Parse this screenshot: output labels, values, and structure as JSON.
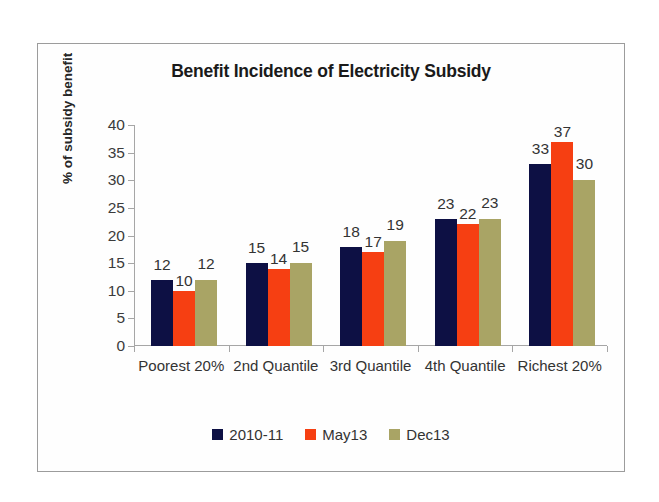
{
  "chart_data": {
    "type": "bar",
    "title": "Benefit Incidence of Electricity Subsidy",
    "xlabel": "",
    "ylabel": "% of subsidy benefit",
    "ylim": [
      0,
      40
    ],
    "yticks": [
      0,
      5,
      10,
      15,
      20,
      25,
      30,
      35,
      40
    ],
    "grid": false,
    "legend_position": "bottom",
    "categories": [
      "Poorest 20%",
      "2nd Quantile",
      "3rd Quantile",
      "4th Quantile",
      "Richest 20%"
    ],
    "series": [
      {
        "name": "2010-11",
        "color": "#0d1044",
        "values": [
          12,
          15,
          18,
          23,
          33
        ]
      },
      {
        "name": "May13",
        "color": "#f63f12",
        "values": [
          10,
          14,
          17,
          22,
          37
        ]
      },
      {
        "name": "Dec13",
        "color": "#a9a465",
        "values": [
          12,
          15,
          19,
          23,
          30
        ]
      }
    ],
    "data_labels": [
      [
        "12",
        "10",
        "12"
      ],
      [
        "15",
        "14",
        "15"
      ],
      [
        "18",
        "17",
        "19"
      ],
      [
        "23",
        "22",
        "23"
      ],
      [
        "33",
        "37",
        "30"
      ]
    ]
  },
  "frame": {
    "border_color": "#9c9c9c",
    "background": "#ffffff"
  }
}
